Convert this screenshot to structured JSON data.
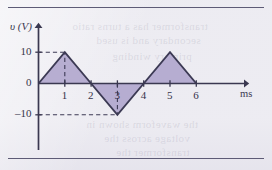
{
  "figure": {
    "background_color": "#ecebf1",
    "rule_color": "#5d5b76",
    "axis_color": "#3a3850",
    "wave_fill_color": "#b3aacf",
    "wave_stroke_color": "#3c3a54",
    "dashed_color": "#3c3a54"
  },
  "axes": {
    "y_axis_label": "υ (V)",
    "x_axis_label": "ms",
    "y_ticks": [
      {
        "label": "10",
        "value": 10
      },
      {
        "label": "0",
        "value": 0
      },
      {
        "label": "–10",
        "value": -10
      }
    ],
    "x_ticks": [
      {
        "label": "1",
        "value": 1
      },
      {
        "label": "2",
        "value": 2
      },
      {
        "label": "3",
        "value": 3
      },
      {
        "label": "4",
        "value": 4
      },
      {
        "label": "5",
        "value": 5
      },
      {
        "label": "6",
        "value": 6
      }
    ]
  },
  "guides": {
    "horizontal": [
      {
        "at_value": 10,
        "to_x": 1
      },
      {
        "at_value": -10,
        "to_x": 3
      }
    ],
    "vertical": [
      {
        "at_x": 1,
        "to_value": 10
      },
      {
        "at_x": 3,
        "to_value": -10
      }
    ]
  },
  "bleed_text": [
    {
      "text": "transformer has a turns ratio",
      "x": 72,
      "y": 20,
      "size": 11
    },
    {
      "text": "secondary and is used",
      "x": 96,
      "y": 34,
      "size": 11
    },
    {
      "text": "primary winding",
      "x": 112,
      "y": 50,
      "size": 11
    },
    {
      "text": "the waveform shown in",
      "x": 86,
      "y": 118,
      "size": 11
    },
    {
      "text": "voltage across the",
      "x": 104,
      "y": 132,
      "size": 11
    },
    {
      "text": "transformer the",
      "x": 116,
      "y": 146,
      "size": 11
    }
  ],
  "chart_data": {
    "type": "line",
    "title": "",
    "xlabel": "ms",
    "ylabel": "υ (V)",
    "xlim": [
      0,
      6.6
    ],
    "ylim": [
      -14,
      14
    ],
    "grid": false,
    "legend": "none",
    "series": [
      {
        "name": "v(t)",
        "x": [
          0,
          1,
          2,
          3,
          4,
          5,
          6
        ],
        "values": [
          0,
          10,
          0,
          -10,
          0,
          10,
          0
        ],
        "fill": true
      }
    ]
  }
}
